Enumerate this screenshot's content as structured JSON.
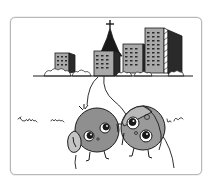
{
  "illustration": {
    "description": "Cartoon of two round characters joined by earphone cords in front of a city skyline with a tower",
    "colors": {
      "frame": "#b8b8b8",
      "building_fill": "#a9a9a9",
      "building_dark": "#2a2a2a",
      "character_left": "#8f8f8f",
      "character_right": "#9a9a9a",
      "ink": "#1a1a1a",
      "background": "#ffffff"
    },
    "elements": [
      "skyline",
      "tower",
      "ground-line",
      "shrubs",
      "earphone-cord",
      "left-character",
      "right-character",
      "grass-scribbles"
    ]
  }
}
